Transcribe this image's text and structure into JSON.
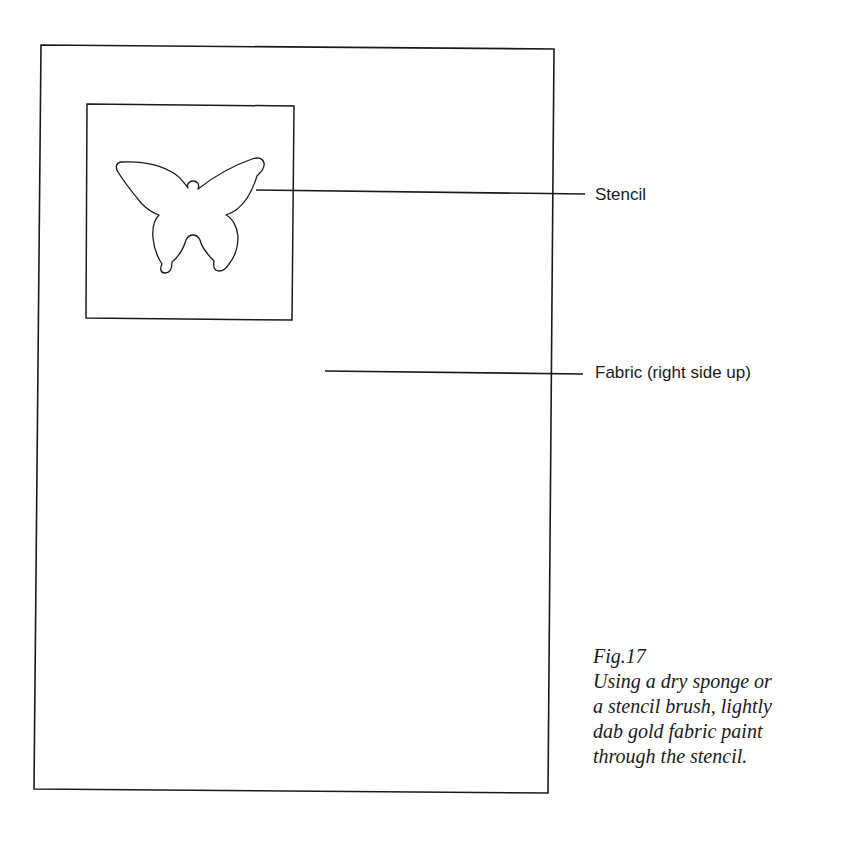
{
  "figure": {
    "labels": {
      "stencil": "Stencil",
      "fabric": "Fabric (right side up)"
    },
    "caption": {
      "number": "Fig.17",
      "lines": [
        "Using a dry sponge or",
        "a stencil brush, lightly",
        "dab gold fabric paint",
        "through the stencil."
      ]
    },
    "shapes": {
      "fabric_outline": "rectangle",
      "stencil_outline": "square",
      "stencil_cutout": "butterfly"
    },
    "colors": {
      "line": "#1a1a1a",
      "background": "#ffffff"
    }
  }
}
